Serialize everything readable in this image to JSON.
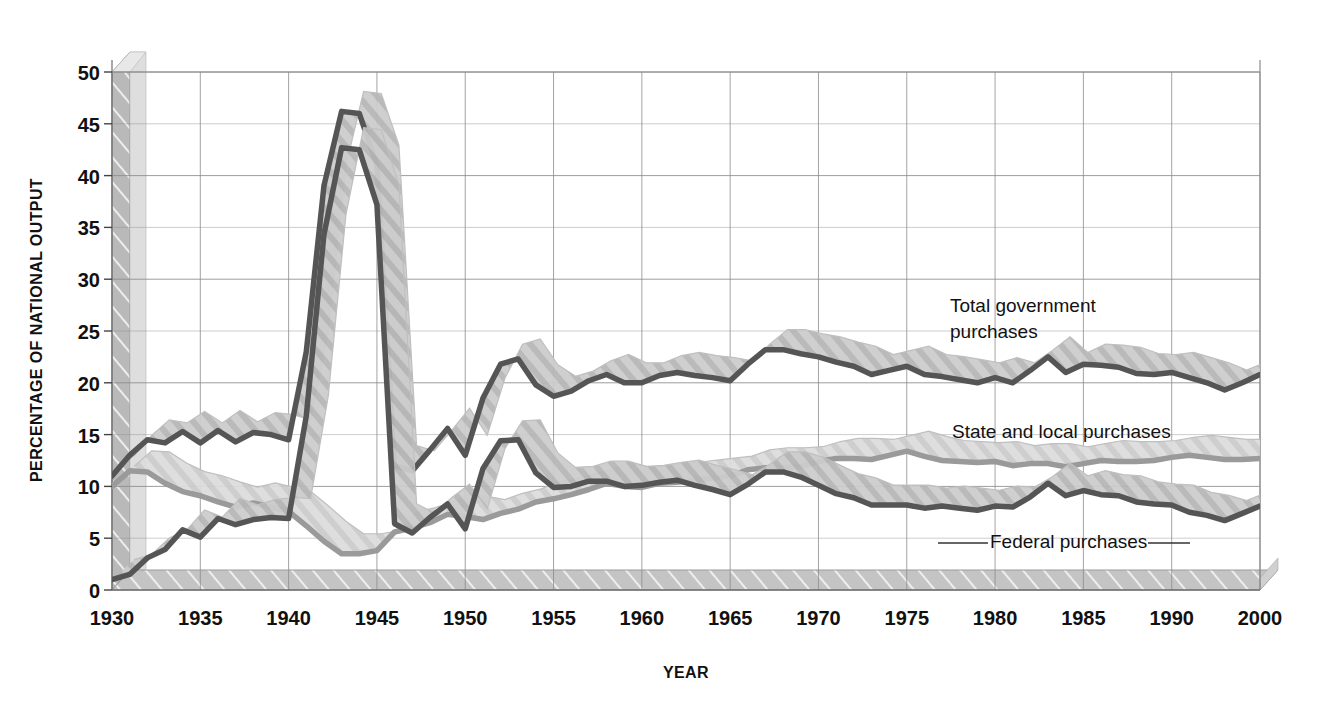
{
  "chart_data": {
    "type": "line",
    "title": "",
    "xlabel": "YEAR",
    "ylabel": "PERCENTAGE OF NATIONAL OUTPUT",
    "xlim": [
      1930,
      1995
    ],
    "ylim": [
      0,
      50
    ],
    "grid": true,
    "legend_position": "inline-annotations",
    "x_tick_labels": [
      "1930",
      "1935",
      "1940",
      "1945",
      "1950",
      "1955",
      "1960",
      "1965",
      "1970",
      "1975",
      "1980",
      "1985",
      "1990",
      "2000"
    ],
    "x_tick_values": [
      1930,
      1935,
      1940,
      1945,
      1950,
      1955,
      1960,
      1965,
      1970,
      1975,
      1980,
      1985,
      1990,
      1995
    ],
    "y_tick_labels": [
      "0",
      "5",
      "10",
      "15",
      "20",
      "25",
      "30",
      "35",
      "40",
      "45",
      "50"
    ],
    "y_tick_values": [
      0,
      5,
      10,
      15,
      20,
      25,
      30,
      35,
      40,
      45,
      50
    ],
    "x": [
      1930,
      1931,
      1932,
      1933,
      1934,
      1935,
      1936,
      1937,
      1938,
      1939,
      1940,
      1941,
      1942,
      1943,
      1944,
      1945,
      1946,
      1947,
      1948,
      1949,
      1950,
      1951,
      1952,
      1953,
      1954,
      1955,
      1956,
      1957,
      1958,
      1959,
      1960,
      1961,
      1962,
      1963,
      1964,
      1965,
      1966,
      1967,
      1968,
      1969,
      1970,
      1971,
      1972,
      1973,
      1974,
      1975,
      1976,
      1977,
      1978,
      1979,
      1980,
      1981,
      1982,
      1983,
      1984,
      1985,
      1986,
      1987,
      1988,
      1989,
      1990,
      1991,
      1992,
      1993,
      1994,
      1995
    ],
    "series": [
      {
        "name": "Total government purchases",
        "color": "#555555",
        "values": [
          11.0,
          13.0,
          14.5,
          14.2,
          15.3,
          14.2,
          15.4,
          14.3,
          15.2,
          15.0,
          14.5,
          23.0,
          39.0,
          46.2,
          46.0,
          41.0,
          12.0,
          11.5,
          13.5,
          15.6,
          13.0,
          18.5,
          21.8,
          22.3,
          19.8,
          18.7,
          19.2,
          20.2,
          20.8,
          20.0,
          20.0,
          20.7,
          21.0,
          20.7,
          20.5,
          20.2,
          21.8,
          23.2,
          23.2,
          22.8,
          22.5,
          22.0,
          21.6,
          20.8,
          21.2,
          21.6,
          20.8,
          20.6,
          20.3,
          20.0,
          20.5,
          20.0,
          21.2,
          22.5,
          21.0,
          21.8,
          21.7,
          21.5,
          20.9,
          20.8,
          21.0,
          20.5,
          20.0,
          19.3,
          20.0,
          20.8
        ]
      },
      {
        "name": "State and local purchases",
        "color": "#9a9a9a",
        "values": [
          10.0,
          11.5,
          11.4,
          10.3,
          9.5,
          9.1,
          8.5,
          8.0,
          8.4,
          8.0,
          7.6,
          6.2,
          4.7,
          3.5,
          3.5,
          3.8,
          5.6,
          6.0,
          6.5,
          7.3,
          7.1,
          6.8,
          7.4,
          7.8,
          8.5,
          8.8,
          9.2,
          9.7,
          10.3,
          10.0,
          9.9,
          10.3,
          10.4,
          10.6,
          10.8,
          11.0,
          11.6,
          11.8,
          11.8,
          11.9,
          12.4,
          12.7,
          12.7,
          12.6,
          13.0,
          13.4,
          12.9,
          12.5,
          12.4,
          12.3,
          12.4,
          12.0,
          12.2,
          12.2,
          11.9,
          12.2,
          12.5,
          12.4,
          12.4,
          12.5,
          12.8,
          13.0,
          12.8,
          12.6,
          12.6,
          12.7
        ]
      },
      {
        "name": "Federal purchases",
        "color": "#555555",
        "values": [
          1.0,
          1.5,
          3.1,
          3.9,
          5.8,
          5.1,
          6.9,
          6.3,
          6.8,
          7.0,
          6.9,
          16.8,
          34.3,
          42.7,
          42.5,
          37.2,
          6.4,
          5.5,
          7.0,
          8.3,
          5.9,
          11.7,
          14.4,
          14.5,
          11.3,
          9.9,
          10.0,
          10.5,
          10.5,
          10.0,
          10.1,
          10.4,
          10.6,
          10.1,
          9.7,
          9.2,
          10.2,
          11.4,
          11.4,
          10.9,
          10.1,
          9.3,
          8.9,
          8.2,
          8.2,
          8.2,
          7.9,
          8.1,
          7.9,
          7.7,
          8.1,
          8.0,
          9.0,
          10.3,
          9.1,
          9.6,
          9.2,
          9.1,
          8.5,
          8.3,
          8.2,
          7.5,
          7.2,
          6.7,
          7.4,
          8.1
        ]
      }
    ],
    "annotations": [
      {
        "name": "total-government-purchases-label",
        "line1": "Total government",
        "line2": "purchases",
        "x_px": 950,
        "y_px": 312
      },
      {
        "name": "state-and-local-purchases-label",
        "line1": "State and local purchases",
        "line2": "",
        "x_px": 952,
        "y_px": 438
      },
      {
        "name": "federal-purchases-label",
        "line1": "Federal purchases",
        "line2": "",
        "x_px": 990,
        "y_px": 548
      }
    ]
  },
  "axes": {
    "y_title": "PERCENTAGE OF NATIONAL OUTPUT",
    "x_title": "YEAR"
  },
  "style": {
    "grid_color": "#8c8c8c",
    "plot_background": "#ffffff",
    "axis_block_light": "#d2d2d2",
    "axis_block_mid": "#b4b4b4",
    "axis_block_dark": "#a0a0a0",
    "ribbon_light": "#d8d8d8",
    "ribbon_mid": "#c0c0c0"
  }
}
